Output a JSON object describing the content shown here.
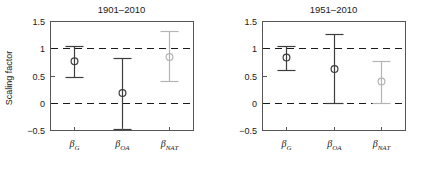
{
  "figure": {
    "ylabel": "Scaling factor",
    "background": "#ffffff"
  },
  "colors": {
    "dark": "#3d3d3d",
    "gray": "#b4b4b4",
    "frame": "#555555",
    "text": "#1a1a1a",
    "refline": "#1a1a1a"
  },
  "chart_data": [
    {
      "type": "scatter",
      "title": "1901–2010",
      "xlabel": "",
      "ylabel": "Scaling factor",
      "ylim": [
        -0.5,
        1.5
      ],
      "yticks": [
        -0.5,
        0,
        0.5,
        1,
        1.5
      ],
      "ytick_labels": [
        "−0.5",
        "0",
        "0.5",
        "1",
        "1.5"
      ],
      "grid": false,
      "reference_lines": [
        0,
        1
      ],
      "categories": [
        "β_G",
        "β_OA",
        "β_NAT"
      ],
      "category_labels": [
        {
          "base": "β",
          "sub": "G"
        },
        {
          "base": "β",
          "sub": "OA"
        },
        {
          "base": "β",
          "sub": "NAT"
        }
      ],
      "series": [
        {
          "name": "Scaling factor best estimate with 5–95% uncertainty range",
          "points": [
            {
              "category": "β_G",
              "value": 0.76,
              "low": 0.47,
              "high": 1.04,
              "color": "dark"
            },
            {
              "category": "β_OA",
              "value": 0.18,
              "low": -0.49,
              "high": 0.82,
              "color": "dark"
            },
            {
              "category": "β_NAT",
              "value": 0.84,
              "low": 0.39,
              "high": 1.31,
              "color": "gray"
            }
          ]
        }
      ]
    },
    {
      "type": "scatter",
      "title": "1951–2010",
      "xlabel": "",
      "ylabel": "",
      "ylim": [
        -0.5,
        1.5
      ],
      "yticks": [
        -0.5,
        0,
        0.5,
        1,
        1.5
      ],
      "ytick_labels": [
        "−0.5",
        "0",
        "0.5",
        "1",
        "1.5"
      ],
      "grid": false,
      "reference_lines": [
        0,
        1
      ],
      "categories": [
        "β_G",
        "β_OA",
        "β_NAT"
      ],
      "category_labels": [
        {
          "base": "β",
          "sub": "G"
        },
        {
          "base": "β",
          "sub": "OA"
        },
        {
          "base": "β",
          "sub": "NAT"
        }
      ],
      "series": [
        {
          "name": "Scaling factor best estimate with 5–95% uncertainty range",
          "points": [
            {
              "category": "β_G",
              "value": 0.83,
              "low": 0.6,
              "high": 1.05,
              "color": "dark"
            },
            {
              "category": "β_OA",
              "value": 0.62,
              "low": 0.0,
              "high": 1.26,
              "color": "dark"
            },
            {
              "category": "β_NAT",
              "value": 0.39,
              "low": 0.0,
              "high": 0.77,
              "color": "gray"
            }
          ]
        }
      ]
    }
  ]
}
